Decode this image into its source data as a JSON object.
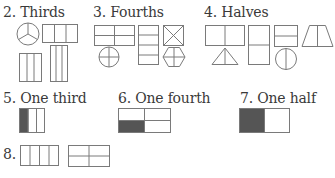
{
  "sections": {
    "thirds": {
      "label": "2. Thirds"
    },
    "fourths": {
      "label": "3. Fourths"
    },
    "halves": {
      "label": "4. Halves"
    },
    "one_third": {
      "label": "5. One third"
    },
    "one_fourth": {
      "label": "6. One fourth"
    },
    "one_half": {
      "label": "7. One half"
    },
    "eight": {
      "label": "8."
    }
  },
  "colors": {
    "stroke": "#7a7a7a",
    "shade": "#555555",
    "text": "#3a3a3a"
  }
}
